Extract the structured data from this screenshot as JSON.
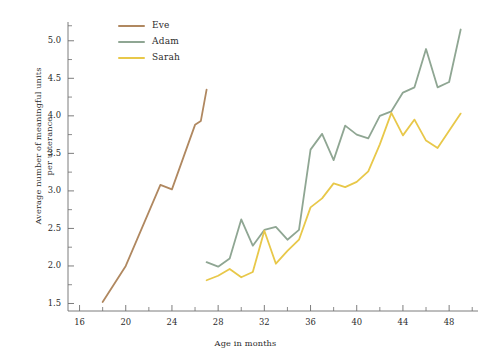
{
  "chart_data": {
    "type": "line",
    "title": "",
    "xlabel": "Age in months",
    "ylabel": "Average number of meaningful units per utterance",
    "ylabel_line1": "Average number of meaningful units",
    "ylabel_line2": "per utterance",
    "xlim": [
      15,
      50.5
    ],
    "ylim": [
      1.4,
      5.25
    ],
    "grid": false,
    "legend_position": "top-left-inside",
    "x_major_ticks": [
      16,
      20,
      24,
      28,
      32,
      36,
      40,
      44,
      48
    ],
    "x_tick_labels": [
      "16",
      "20",
      "24",
      "28",
      "32",
      "36",
      "40",
      "44",
      "48"
    ],
    "x_minor_ticks": [
      18,
      22,
      26,
      30,
      34,
      38,
      42,
      46,
      50
    ],
    "y_major_ticks": [
      1.5,
      2.0,
      2.5,
      3.0,
      3.5,
      4.0,
      4.5,
      5.0
    ],
    "y_tick_labels": [
      "1.5",
      "2.0",
      "2.5",
      "3.0",
      "3.5",
      "4.0",
      "4.5",
      "5.0"
    ],
    "y_minor_ticks": [
      1.75,
      2.25,
      2.75,
      3.25,
      3.75,
      4.25,
      4.75,
      5.2
    ],
    "series": [
      {
        "name": "Eve",
        "color": "#b08860",
        "x": [
          18,
          19,
          20,
          21,
          22,
          23,
          24,
          25,
          26,
          26.5,
          27
        ],
        "values": [
          1.52,
          1.76,
          2.0,
          2.36,
          2.72,
          3.08,
          3.02,
          3.45,
          3.88,
          3.93,
          4.35
        ]
      },
      {
        "name": "Adam",
        "color": "#8fa693",
        "x": [
          27,
          28,
          29,
          30,
          31,
          32,
          33,
          34,
          35,
          36,
          37,
          38,
          39,
          40,
          41,
          42,
          43,
          44,
          45,
          46,
          47,
          48,
          49
        ],
        "values": [
          2.05,
          1.99,
          2.1,
          2.62,
          2.27,
          2.48,
          2.52,
          2.35,
          2.48,
          3.55,
          3.76,
          3.41,
          3.87,
          3.75,
          3.7,
          4.0,
          4.06,
          4.31,
          4.38,
          4.89,
          4.38,
          4.45,
          5.15
        ]
      },
      {
        "name": "Sarah",
        "color": "#e8c84a",
        "x": [
          27,
          28,
          29,
          30,
          31,
          32,
          33,
          34,
          35,
          36,
          37,
          38,
          39,
          40,
          41,
          42,
          43,
          44,
          45,
          46,
          47,
          48,
          49
        ],
        "values": [
          1.81,
          1.87,
          1.96,
          1.85,
          1.92,
          2.47,
          2.03,
          2.2,
          2.35,
          2.78,
          2.9,
          3.1,
          3.05,
          3.12,
          3.26,
          3.62,
          4.04,
          3.74,
          3.95,
          3.67,
          3.57,
          3.8,
          4.03
        ]
      }
    ]
  },
  "legend": {
    "items": [
      {
        "label": "Eve",
        "color": "#b08860"
      },
      {
        "label": "Adam",
        "color": "#8fa693"
      },
      {
        "label": "Sarah",
        "color": "#e8c84a"
      }
    ]
  },
  "style": {
    "axis_color": "#6e6e6e",
    "background": "#ffffff",
    "text_color": "#2b2b2b"
  }
}
